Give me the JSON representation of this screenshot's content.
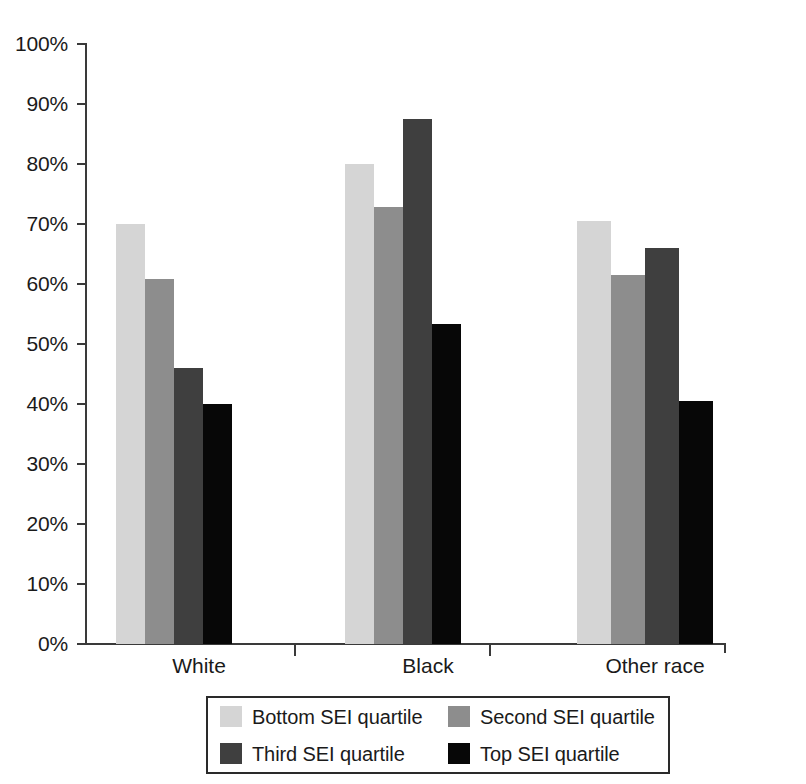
{
  "chart_data": {
    "type": "bar",
    "title": "",
    "subtitle": "",
    "xlabel": "",
    "ylabel": "",
    "categories": [
      "White",
      "Black",
      "Other race"
    ],
    "series": [
      {
        "name": "Bottom SEI quartile",
        "color": "#d5d5d5",
        "values": [
          70.0,
          80.0,
          70.5
        ]
      },
      {
        "name": "Second SEI quartile",
        "color": "#8d8d8d",
        "values": [
          60.8,
          72.8,
          61.5
        ]
      },
      {
        "name": "Third SEI quartile",
        "color": "#3f3f3f",
        "values": [
          46.0,
          87.5,
          66.0
        ]
      },
      {
        "name": "Top SEI quartile",
        "color": "#070707",
        "values": [
          40.0,
          53.3,
          40.5
        ]
      }
    ],
    "ylim": [
      0,
      100
    ],
    "ytick_values": [
      0,
      10,
      20,
      30,
      40,
      50,
      60,
      70,
      80,
      90,
      100
    ],
    "ytick_labels": [
      "0%",
      "10%",
      "20%",
      "30%",
      "40%",
      "50%",
      "60%",
      "70%",
      "80%",
      "90%",
      "100%"
    ],
    "value_suffix": "%",
    "grid": false,
    "legend_position": "bottom"
  },
  "legend": {
    "items": [
      {
        "label": "Bottom SEI quartile",
        "color": "#d5d5d5",
        "swatch": "legend-swatch-bottom"
      },
      {
        "label": "Second SEI quartile",
        "color": "#8d8d8d",
        "swatch": "legend-swatch-second"
      },
      {
        "label": "Third SEI quartile",
        "color": "#3f3f3f",
        "swatch": "legend-swatch-third"
      },
      {
        "label": "Top SEI quartile",
        "color": "#070707",
        "swatch": "legend-swatch-top"
      }
    ]
  }
}
